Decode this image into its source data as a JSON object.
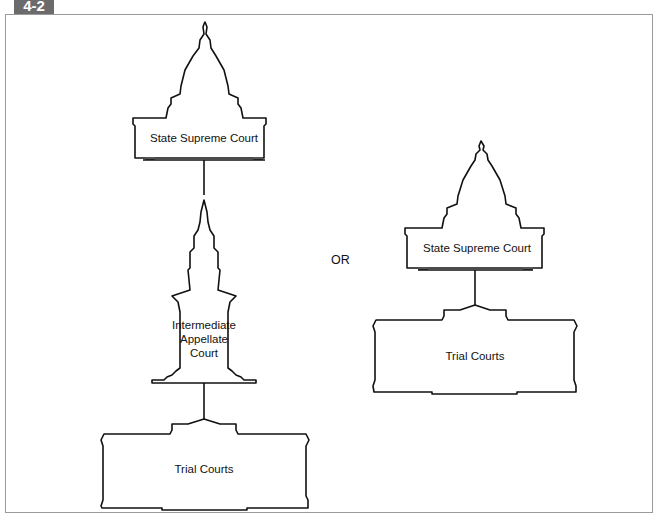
{
  "figure": {
    "number": "4-2",
    "title_cropped": ""
  },
  "left_structure": {
    "top": {
      "label": "State Supreme Court",
      "icon": "capitol-dome-building"
    },
    "middle": {
      "label_lines": [
        "Intermediate",
        "Appellate",
        "Court"
      ],
      "icon": "steeple-building"
    },
    "bottom": {
      "label": "Trial Courts",
      "icon": "courthouse-building"
    }
  },
  "separator": "OR",
  "right_structure": {
    "top": {
      "label": "State Supreme Court",
      "icon": "capitol-dome-building"
    },
    "bottom": {
      "label": "Trial Courts",
      "icon": "courthouse-building"
    }
  },
  "colors": {
    "badge": "#6b6b6b",
    "frame": "#9a9a9a",
    "line": "#111111"
  }
}
